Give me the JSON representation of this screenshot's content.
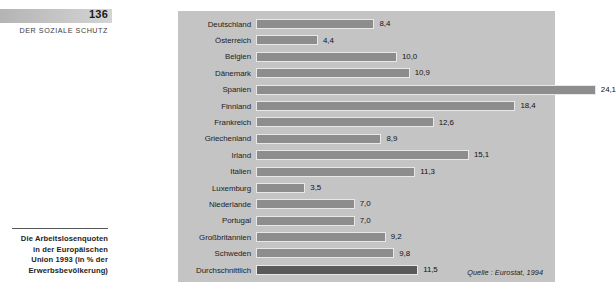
{
  "sidebar": {
    "page_number": "136",
    "section_title": "DER SOZIALE SCHUTZ",
    "caption": "Die Arbeitslosenquoten in der Europäischen Union 1993 (in % der Erwerbsbevölkerung)"
  },
  "chart": {
    "source": "Quelle : Eurostat, 1994"
  },
  "chart_data": {
    "type": "bar",
    "orientation": "horizontal",
    "title": "Die Arbeitslosenquoten in der Europäischen Union 1993 (in % der Erwerbsbevölkerung)",
    "xlabel": "",
    "ylabel": "",
    "xlim": [
      0,
      24.1
    ],
    "grid": false,
    "legend": "none",
    "value_format": "comma-decimal",
    "source": "Quelle : Eurostat, 1994",
    "categories": [
      "Deutschland",
      "Österreich",
      "Belgien",
      "Dänemark",
      "Spanien",
      "Finnland",
      "Frankreich",
      "Griechenland",
      "Irland",
      "Italien",
      "Luxemburg",
      "Niederlande",
      "Portugal",
      "Großbritannien",
      "Schweden",
      "Durchschnittlich"
    ],
    "values": [
      8.4,
      4.4,
      10.0,
      10.9,
      24.1,
      18.4,
      12.6,
      8.9,
      15.1,
      11.3,
      3.5,
      7.0,
      7.0,
      9.2,
      9.8,
      11.5
    ],
    "labels": [
      "8,4",
      "4,4",
      "10,0",
      "10,9",
      "24,1",
      "18,4",
      "12,6",
      "8,9",
      "15,1",
      "11,3",
      "3,5",
      "7,0",
      "7,0",
      "9,2",
      "9,8",
      "11,5"
    ],
    "highlight_index": 15,
    "colors": {
      "bar": "#8d8d8d",
      "bar_highlight": "#595959",
      "panel_background": "#c4c4c4",
      "page_background": "#ffffff"
    }
  }
}
